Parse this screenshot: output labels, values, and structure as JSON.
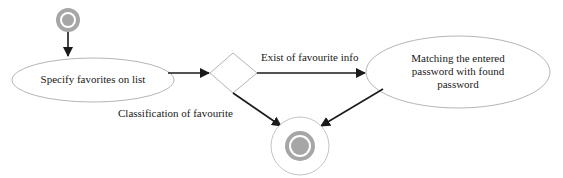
{
  "diagram": {
    "type": "activity-diagram",
    "nodes": [
      {
        "id": "start",
        "kind": "initial-node"
      },
      {
        "id": "specify",
        "kind": "activity",
        "label": "Specify favorites on list"
      },
      {
        "id": "decision",
        "kind": "decision"
      },
      {
        "id": "matching",
        "kind": "activity",
        "label_lines": [
          "Matching the entered",
          "password with found",
          "password"
        ]
      },
      {
        "id": "end",
        "kind": "final-node"
      }
    ],
    "edges": [
      {
        "from": "start",
        "to": "specify",
        "label": ""
      },
      {
        "from": "specify",
        "to": "decision",
        "label": ""
      },
      {
        "from": "decision",
        "to": "matching",
        "label": "Exist of favourite info"
      },
      {
        "from": "decision",
        "to": "end",
        "label": "Classification of favourite"
      },
      {
        "from": "matching",
        "to": "end",
        "label": ""
      }
    ],
    "labels": {
      "specify": "Specify favorites on list",
      "matching_line1": "Matching the entered",
      "matching_line2": "password with found",
      "matching_line3": "password",
      "edge_exist": "Exist of favourite info",
      "edge_classification": "Classification of favourite"
    },
    "colors": {
      "node_stroke": "#b5b5b5",
      "node_fill_gray": "#a6a6a6",
      "arrow": "#1a1a1a",
      "background": "#ffffff"
    }
  }
}
